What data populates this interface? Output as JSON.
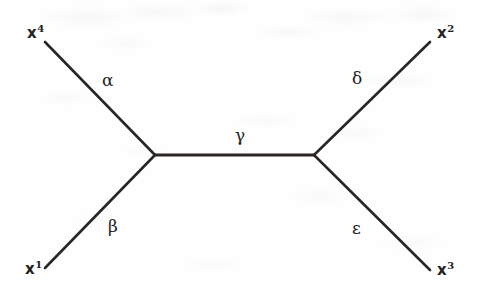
{
  "figure": {
    "kind": "tree-diagram",
    "width": 481,
    "height": 289,
    "background_color": "#fefefe",
    "stroke_color": "#2a2623",
    "text_color": "#25211f"
  },
  "vertices": {
    "left": {
      "name": "left-vertex",
      "x": 155,
      "y": 155
    },
    "right": {
      "name": "right-vertex",
      "x": 314,
      "y": 155
    }
  },
  "endpoints": [
    {
      "id": "x4",
      "base": "x",
      "superscript": "4",
      "label": "x4",
      "x": 45,
      "y": 42,
      "label_x": 27,
      "label_y": 24
    },
    {
      "id": "x1",
      "base": "x",
      "superscript": "1",
      "label": "x1",
      "x": 45,
      "y": 268,
      "label_x": 25,
      "label_y": 260
    },
    {
      "id": "x2",
      "base": "x",
      "superscript": "2",
      "label": "x2",
      "x": 430,
      "y": 42,
      "label_x": 437,
      "label_y": 24
    },
    {
      "id": "x3",
      "base": "x",
      "superscript": "3",
      "label": "x3",
      "x": 430,
      "y": 270,
      "label_x": 437,
      "label_y": 261
    }
  ],
  "edges": [
    {
      "id": "alpha",
      "label": "α",
      "from": "x4",
      "to": "left",
      "label_x": 102,
      "label_y": 72
    },
    {
      "id": "beta",
      "label": "β",
      "from": "x1",
      "to": "left",
      "label_x": 108,
      "label_y": 218
    },
    {
      "id": "gamma",
      "label": "γ",
      "from": "left",
      "to": "right",
      "label_x": 235,
      "label_y": 127
    },
    {
      "id": "delta",
      "label": "δ",
      "from": "right",
      "to": "x2",
      "label_x": 352,
      "label_y": 70
    },
    {
      "id": "epsilon",
      "label": "ε",
      "from": "right",
      "to": "x3",
      "label_x": 352,
      "label_y": 220
    }
  ],
  "chart_data": {
    "type": "diagram",
    "title": "",
    "nodes": [
      {
        "id": "x4",
        "type": "external",
        "label": "x4",
        "x": 45,
        "y": 42
      },
      {
        "id": "x1",
        "type": "external",
        "label": "x1",
        "x": 45,
        "y": 268
      },
      {
        "id": "x2",
        "type": "external",
        "label": "x2",
        "x": 430,
        "y": 42
      },
      {
        "id": "x3",
        "type": "external",
        "label": "x3",
        "x": 430,
        "y": 270
      },
      {
        "id": "left",
        "type": "internal",
        "label": "",
        "x": 155,
        "y": 155
      },
      {
        "id": "right",
        "type": "internal",
        "label": "",
        "x": 314,
        "y": 155
      }
    ],
    "links": [
      {
        "source": "x4",
        "target": "left",
        "label": "α"
      },
      {
        "source": "x1",
        "target": "left",
        "label": "β"
      },
      {
        "source": "left",
        "target": "right",
        "label": "γ"
      },
      {
        "source": "right",
        "target": "x2",
        "label": "δ"
      },
      {
        "source": "right",
        "target": "x3",
        "label": "ε"
      }
    ],
    "legend": [],
    "grid": false
  }
}
